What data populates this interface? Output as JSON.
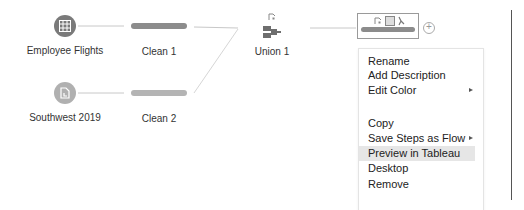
{
  "flow": {
    "inputs": [
      {
        "name": "Employee Flights",
        "icon": "table-grid-icon",
        "color": "#7a7a7a"
      },
      {
        "name": "Southwest 2019",
        "icon": "file-icon",
        "color": "#b0b0b0"
      }
    ],
    "clean_steps": [
      {
        "name": "Clean 1",
        "color": "#8c8c8c"
      },
      {
        "name": "Clean 2",
        "color": "#b4b4b4"
      }
    ],
    "union": {
      "name": "Union 1",
      "color": "#6e6e6e"
    },
    "selected_step": {
      "name": "",
      "color": "#8c8c8c",
      "add_button": "+"
    }
  },
  "context_menu": {
    "items": [
      {
        "label": "Rename",
        "submenu": false
      },
      {
        "label": "Add Description",
        "submenu": false
      },
      {
        "label": "Edit Color",
        "submenu": true
      },
      {
        "label": "Copy",
        "submenu": false
      },
      {
        "label": "Save Steps as Flow",
        "submenu": true
      },
      {
        "label": "Preview in Tableau Desktop",
        "submenu": false,
        "highlighted": true
      },
      {
        "label": "Remove",
        "submenu": false
      }
    ]
  }
}
